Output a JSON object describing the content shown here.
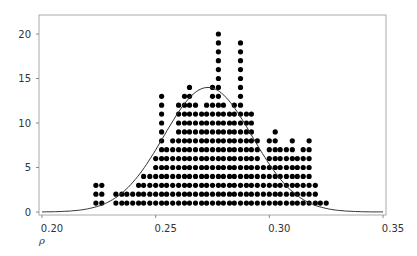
{
  "chart_data": {
    "type": "scatter",
    "subtype": "dot-histogram-with-density",
    "title": "",
    "xlabel": "ρ",
    "ylabel": "",
    "xlim": [
      0.2,
      0.35
    ],
    "ylim": [
      0,
      22
    ],
    "x_ticks": [
      "0.20",
      "0.25",
      "0.30",
      "0.35"
    ],
    "y_ticks": [
      "0",
      "5",
      "10",
      "15",
      "20"
    ],
    "grid": false,
    "legend": null,
    "columns": [
      {
        "x": 0.2237,
        "count": 3
      },
      {
        "x": 0.2263,
        "count": 3
      },
      {
        "x": 0.2325,
        "count": 2
      },
      {
        "x": 0.2351,
        "count": 2
      },
      {
        "x": 0.2373,
        "count": 2
      },
      {
        "x": 0.2399,
        "count": 2
      },
      {
        "x": 0.2425,
        "count": 3
      },
      {
        "x": 0.2447,
        "count": 4
      },
      {
        "x": 0.2474,
        "count": 4
      },
      {
        "x": 0.25,
        "count": 6
      },
      {
        "x": 0.2526,
        "count": 13
      },
      {
        "x": 0.2548,
        "count": 7
      },
      {
        "x": 0.2575,
        "count": 8
      },
      {
        "x": 0.2601,
        "count": 12
      },
      {
        "x": 0.2627,
        "count": 13
      },
      {
        "x": 0.2649,
        "count": 14
      },
      {
        "x": 0.2675,
        "count": 12
      },
      {
        "x": 0.2702,
        "count": 11
      },
      {
        "x": 0.2724,
        "count": 12
      },
      {
        "x": 0.275,
        "count": 14
      },
      {
        "x": 0.2776,
        "count": 20
      },
      {
        "x": 0.2798,
        "count": 12
      },
      {
        "x": 0.2825,
        "count": 11
      },
      {
        "x": 0.2846,
        "count": 12
      },
      {
        "x": 0.2873,
        "count": 19
      },
      {
        "x": 0.2899,
        "count": 11
      },
      {
        "x": 0.2921,
        "count": 11
      },
      {
        "x": 0.2947,
        "count": 8
      },
      {
        "x": 0.2974,
        "count": 5
      },
      {
        "x": 0.3,
        "count": 8
      },
      {
        "x": 0.3026,
        "count": 9
      },
      {
        "x": 0.3048,
        "count": 7
      },
      {
        "x": 0.3075,
        "count": 7
      },
      {
        "x": 0.3101,
        "count": 8
      },
      {
        "x": 0.3123,
        "count": 6
      },
      {
        "x": 0.3149,
        "count": 7
      },
      {
        "x": 0.3175,
        "count": 8
      },
      {
        "x": 0.3202,
        "count": 3
      },
      {
        "x": 0.3224,
        "count": 1
      },
      {
        "x": 0.325,
        "count": 1
      }
    ],
    "density_curve": {
      "distribution": "normal",
      "mean": 0.273,
      "sd": 0.0195,
      "peak_y": 14
    }
  },
  "axes": {
    "x_label": "ρ",
    "x_ticks": [
      {
        "label": "0.20",
        "value": 0.2
      },
      {
        "label": "0.25",
        "value": 0.25
      },
      {
        "label": "0.30",
        "value": 0.3
      },
      {
        "label": "0.35",
        "value": 0.35
      }
    ],
    "y_ticks": [
      {
        "label": "0",
        "value": 0
      },
      {
        "label": "5",
        "value": 5
      },
      {
        "label": "10",
        "value": 10
      },
      {
        "label": "15",
        "value": 15
      },
      {
        "label": "20",
        "value": 20
      }
    ]
  },
  "colors": {
    "dots": "#000000",
    "curve": "#333333",
    "frame": "#aaaaaa",
    "text": "#333333"
  }
}
